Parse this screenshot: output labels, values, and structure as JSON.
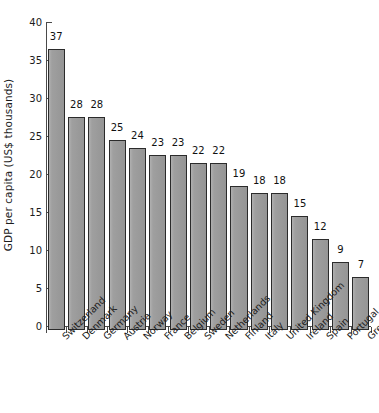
{
  "chart_data": {
    "type": "bar",
    "title": "",
    "subtitle": "",
    "xlabel": "",
    "ylabel": "GDP per capita (US$ thousands)",
    "ylim": [
      0,
      40
    ],
    "ytick_step": 5,
    "yticks": [
      "0",
      "5",
      "10",
      "15",
      "20",
      "25",
      "30",
      "35",
      "40"
    ],
    "grid": false,
    "legend": null,
    "bar_color": "#9a9a9a",
    "bar_edge_color": "#2b2b2b",
    "axis_color": "#4a4a4a",
    "data_labels_shown": true,
    "xtick_label_rotation": -45,
    "categories": [
      "Switzerland",
      "Denmark",
      "Germany",
      "Austria",
      "Norway",
      "France",
      "Belgium",
      "Sweden",
      "Netherlands",
      "Finland",
      "Italy",
      "United Kingdom",
      "Ireland",
      "Spain",
      "Portugal",
      "Greece"
    ],
    "values": [
      37,
      28,
      28,
      25,
      24,
      23,
      23,
      22,
      22,
      19,
      18,
      18,
      15,
      12,
      9,
      7
    ],
    "value_labels": [
      "37",
      "28",
      "28",
      "25",
      "24",
      "23",
      "23",
      "22",
      "22",
      "19",
      "18",
      "18",
      "15",
      "12",
      "9",
      "7"
    ]
  }
}
